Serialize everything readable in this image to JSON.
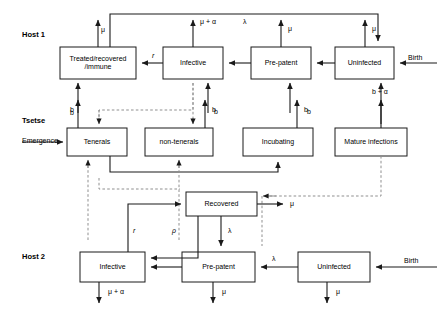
{
  "figure": {
    "type": "compartmental-flow-diagram",
    "title": "",
    "rows": [
      {
        "id": "host1",
        "label": "Host 1"
      },
      {
        "id": "tsetse",
        "label": "Tsetse"
      },
      {
        "id": "host2",
        "label": "Host 2"
      }
    ]
  },
  "row_labels": {
    "host1": "Host 1",
    "tsetse": "Tsetse",
    "host2": "Host 2"
  },
  "host1": {
    "boxes": [
      {
        "id": "h1-treated",
        "label": "Treated/recovered\n/immune"
      },
      {
        "id": "h1-infective",
        "label": "Infective"
      },
      {
        "id": "h1-prepatent",
        "label": "Pre-patent"
      },
      {
        "id": "h1-uninfected",
        "label": "Uninfected"
      }
    ],
    "box_labels": {
      "treated_line1": "Treated/recovered",
      "treated_line2": "/immune",
      "infective": "Infective",
      "prepatent": "Pre-patent",
      "uninfected": "Uninfected"
    },
    "rates": {
      "mu_treated": "μ",
      "mu_alpha_infective": "μ + α",
      "lambda_top": "λ",
      "mu_prepatent": "μ",
      "mu_uninfected": "μ",
      "r_recovery": "r",
      "birth": "Birth",
      "b_treated": "b",
      "b_infective": "b",
      "b_prepatent": "b",
      "b_alpha_uninfected": "b + α"
    }
  },
  "tsetse": {
    "boxes": [
      {
        "id": "ts-tenerals",
        "label": "Tenerals"
      },
      {
        "id": "ts-nontenerals",
        "label": "non-tenerals"
      },
      {
        "id": "ts-incubating",
        "label": "Incubating"
      },
      {
        "id": "ts-mature",
        "label": "Mature infections"
      }
    ],
    "box_labels": {
      "tenerals": "Tenerals",
      "nontenerals": "non-tenerals",
      "incubating": "Incubating",
      "mature": "Mature infections"
    },
    "rates": {
      "emergence": "Emergence",
      "b_tenerals": "b",
      "b_nontenerals": "b",
      "b_incubating": "b"
    }
  },
  "host2": {
    "boxes": [
      {
        "id": "h2-recovered",
        "label": "Recovered"
      },
      {
        "id": "h2-infective",
        "label": "Infective"
      },
      {
        "id": "h2-prepatent",
        "label": "Pre-patent"
      },
      {
        "id": "h2-uninfected",
        "label": "Uninfected"
      }
    ],
    "box_labels": {
      "recovered": "Recovered",
      "infective": "Infective",
      "prepatent": "Pre-patent",
      "uninfected": "Uninfected"
    },
    "rates": {
      "mu_recovered": "μ",
      "r_recovery": "r",
      "rho_relapse": "ρ",
      "lambda_recovered": "λ",
      "lambda_uninfected": "λ",
      "mu_alpha_infective": "μ + α",
      "mu_prepatent": "μ",
      "mu_uninfected": "μ",
      "birth": "Birth"
    }
  },
  "style": {
    "stroke": "#1a1a1a",
    "dashed_stroke": "#8c8c8c",
    "box_fill": "#ffffff",
    "text": "#000000"
  }
}
